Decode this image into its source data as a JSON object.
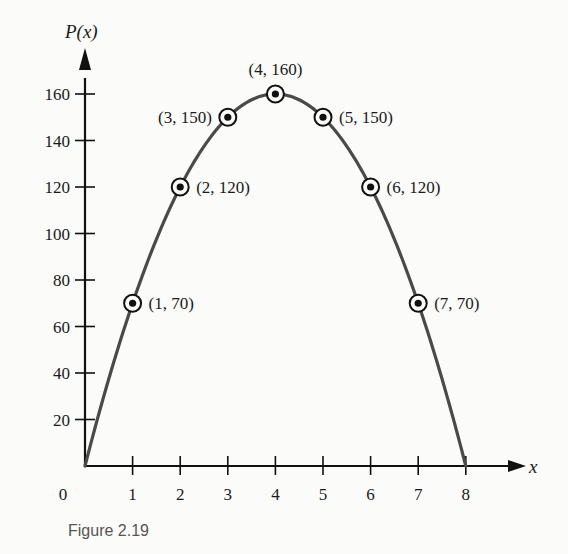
{
  "chart_data": {
    "type": "line",
    "title": "",
    "caption": "Figure 2.19",
    "xlabel": "x",
    "ylabel": "P(x)",
    "xlim": [
      0,
      8
    ],
    "ylim": [
      0,
      170
    ],
    "grid": false,
    "legend": null,
    "x_ticks": [
      0,
      1,
      2,
      3,
      4,
      5,
      6,
      7,
      8
    ],
    "y_ticks": [
      20,
      40,
      60,
      80,
      100,
      120,
      140,
      160
    ],
    "function": "P(x) = -10x^2 + 80x",
    "series": [
      {
        "name": "P(x)",
        "x": [
          0,
          1,
          2,
          3,
          4,
          5,
          6,
          7,
          8
        ],
        "values": [
          0,
          70,
          120,
          150,
          160,
          150,
          120,
          70,
          0
        ]
      }
    ],
    "annotations": [
      {
        "x": 1,
        "y": 70,
        "label": "(1, 70)",
        "side": "right"
      },
      {
        "x": 2,
        "y": 120,
        "label": "(2, 120)",
        "side": "right"
      },
      {
        "x": 3,
        "y": 150,
        "label": "(3, 150)",
        "side": "left"
      },
      {
        "x": 4,
        "y": 160,
        "label": "(4, 160)",
        "side": "top"
      },
      {
        "x": 5,
        "y": 150,
        "label": "(5, 150)",
        "side": "right"
      },
      {
        "x": 6,
        "y": 120,
        "label": "(6, 120)",
        "side": "right"
      },
      {
        "x": 7,
        "y": 70,
        "label": "(7, 70)",
        "side": "right"
      }
    ]
  },
  "layout": {
    "origin_px": [
      85,
      466
    ],
    "x_px_per_unit": 47.6,
    "y_px_per_unit": 2.325,
    "curve_color": "#4a4a4a",
    "axis_color": "#111111"
  }
}
